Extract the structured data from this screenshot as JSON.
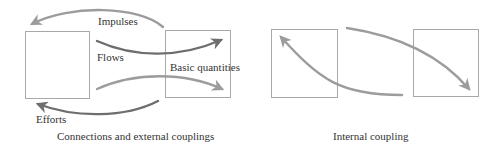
{
  "colors": {
    "box_stroke": "#a8a8a8",
    "arrow_dark": "#6e6e6e",
    "arrow_light": "#9c9c9c",
    "text": "#333333",
    "background": "#ffffff"
  },
  "panels": [
    {
      "id": "external",
      "caption": "Connections and external couplings",
      "boxes": [
        {
          "name": "left-element",
          "x": 25,
          "y": 31,
          "w": 64,
          "h": 67
        },
        {
          "name": "right-element",
          "x": 165,
          "y": 30,
          "w": 65,
          "h": 67
        }
      ],
      "labels": {
        "impulses": "Impulses",
        "flows": "Flows",
        "basic_quantities": "Basic quantities",
        "efforts": "Efforts"
      },
      "arrows": [
        {
          "name": "impulses-arrow",
          "direction": "right-to-left",
          "shade": "light"
        },
        {
          "name": "flows-arrow",
          "direction": "left-to-right",
          "shade": "dark"
        },
        {
          "name": "lower-flow-arrow",
          "direction": "left-to-right",
          "shade": "light"
        },
        {
          "name": "efforts-arrow",
          "direction": "right-to-left",
          "shade": "dark"
        }
      ]
    },
    {
      "id": "internal",
      "caption": "Internal coupling",
      "boxes": [
        {
          "name": "left-element",
          "x": 271,
          "y": 29,
          "w": 66,
          "h": 68
        },
        {
          "name": "right-element",
          "x": 413,
          "y": 29,
          "w": 65,
          "h": 67
        }
      ],
      "arrows": [
        {
          "name": "internal-upward-arrow",
          "direction": "right-to-left",
          "shade": "light"
        },
        {
          "name": "internal-downward-arrow",
          "direction": "left-to-right",
          "shade": "light"
        }
      ]
    }
  ]
}
